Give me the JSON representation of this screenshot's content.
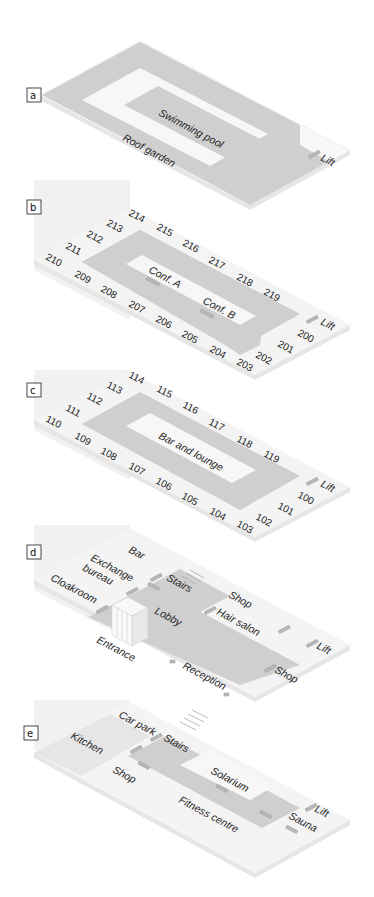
{
  "floors": [
    {
      "tag": "a",
      "name": "Roof",
      "labels": {
        "pool": "Swimming pool",
        "garden": "Roof garden",
        "lift": "Lift"
      }
    },
    {
      "tag": "b",
      "name": "Second floor",
      "labels": {
        "confA": "Conf. A",
        "confB": "Conf. B",
        "lift": "Lift"
      },
      "rooms_back": [
        "214",
        "215",
        "216",
        "217",
        "218",
        "219"
      ],
      "rooms_left": [
        "213",
        "212",
        "211",
        "210"
      ],
      "rooms_front": [
        "209",
        "208",
        "207",
        "206",
        "205",
        "204",
        "203"
      ],
      "rooms_right": [
        "202",
        "201",
        "200"
      ]
    },
    {
      "tag": "c",
      "name": "First floor",
      "labels": {
        "bar": "Bar and lounge",
        "lift": "Lift"
      },
      "rooms_back": [
        "114",
        "115",
        "116",
        "117",
        "118",
        "119"
      ],
      "rooms_left": [
        "113",
        "112",
        "111",
        "110"
      ],
      "rooms_front": [
        "109",
        "108",
        "107",
        "106",
        "105",
        "104",
        "103"
      ],
      "rooms_right": [
        "102",
        "101",
        "100"
      ]
    },
    {
      "tag": "d",
      "name": "Ground floor",
      "labels": {
        "bar": "Bar",
        "exchange1": "Exchange",
        "exchange2": "bureau",
        "cloakroom": "Cloakroom",
        "stairs": "Stairs",
        "shop1": "Shop",
        "hair": "Hair salon",
        "lobby": "Lobby",
        "entrance": "Entrance",
        "reception": "Reception",
        "shop2": "Shop",
        "lift": "Lift"
      }
    },
    {
      "tag": "e",
      "name": "Basement",
      "labels": {
        "carpark": "Car park",
        "stairs": "Stairs",
        "kitchen": "Kitchen",
        "shop": "Shop",
        "solarium": "Solarium",
        "fitness": "Fitness centre",
        "sauna": "Sauna",
        "lift": "Lift"
      }
    }
  ],
  "colors": {
    "corridor": "#cfcfcf",
    "floor": "#f4f4f4",
    "wall": "#ececec",
    "door": "#b8b8b8",
    "text": "#222222"
  }
}
